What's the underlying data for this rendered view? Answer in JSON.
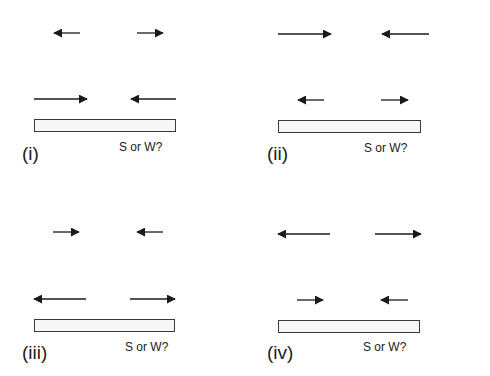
{
  "colors": {
    "arrow": "#1a1a1a",
    "bar_border": "#3a3a3a",
    "bar_fill": "#f7f7f7"
  },
  "panels": [
    {
      "label": "(i)",
      "question": "S or W?",
      "top_arrows": [
        {
          "dir": "left",
          "length": "short"
        },
        {
          "dir": "right",
          "length": "short"
        }
      ],
      "bottom_arrows": [
        {
          "dir": "right",
          "length": "long"
        },
        {
          "dir": "left",
          "length": "long"
        }
      ]
    },
    {
      "label": "(ii)",
      "question": "S or W?",
      "top_arrows": [
        {
          "dir": "right",
          "length": "long"
        },
        {
          "dir": "left",
          "length": "long"
        }
      ],
      "bottom_arrows": [
        {
          "dir": "left",
          "length": "short"
        },
        {
          "dir": "right",
          "length": "short"
        }
      ]
    },
    {
      "label": "(iii)",
      "question": "S or W?",
      "top_arrows": [
        {
          "dir": "right",
          "length": "short"
        },
        {
          "dir": "left",
          "length": "short"
        }
      ],
      "bottom_arrows": [
        {
          "dir": "left",
          "length": "long"
        },
        {
          "dir": "right",
          "length": "long"
        }
      ]
    },
    {
      "label": "(iv)",
      "question": "S or W?",
      "top_arrows": [
        {
          "dir": "left",
          "length": "long"
        },
        {
          "dir": "right",
          "length": "long"
        }
      ],
      "bottom_arrows": [
        {
          "dir": "right",
          "length": "short"
        },
        {
          "dir": "left",
          "length": "short"
        }
      ]
    }
  ]
}
